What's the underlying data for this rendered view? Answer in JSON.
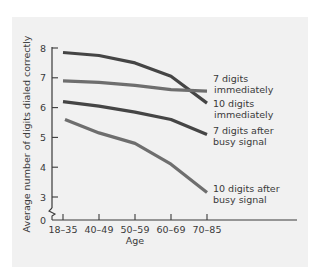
{
  "chart_data": {
    "type": "line",
    "title": "",
    "xlabel": "Age",
    "ylabel": "Average number of digits dialed correctly",
    "categories": [
      "18–35",
      "40–49",
      "50–59",
      "60–69",
      "70–85"
    ],
    "y_ticks": [
      "0",
      "3",
      "4",
      "5",
      "6",
      "7",
      "8"
    ],
    "ylim": [
      3,
      8
    ],
    "y_axis_break": true,
    "grid": false,
    "legend_position": "inline-right",
    "series": [
      {
        "name": "10 digits immediately",
        "label_lines": [
          "10 digits",
          "immediately"
        ],
        "color": "#454545",
        "values": [
          7.85,
          7.75,
          7.5,
          7.05,
          6.15
        ]
      },
      {
        "name": "7 digits immediately",
        "label_lines": [
          "7 digits",
          "immediately"
        ],
        "color": "#6e6e6e",
        "values": [
          6.9,
          6.85,
          6.75,
          6.6,
          6.55
        ]
      },
      {
        "name": "7 digits after busy signal",
        "label_lines": [
          "7 digits after",
          "busy signal"
        ],
        "color": "#454545",
        "values": [
          6.2,
          6.05,
          5.85,
          5.6,
          5.1
        ]
      },
      {
        "name": "10 digits after busy signal",
        "label_lines": [
          "10 digits after",
          "busy signal"
        ],
        "color": "#6e6e6e",
        "values": [
          5.6,
          5.15,
          4.8,
          4.1,
          3.15
        ]
      }
    ]
  }
}
